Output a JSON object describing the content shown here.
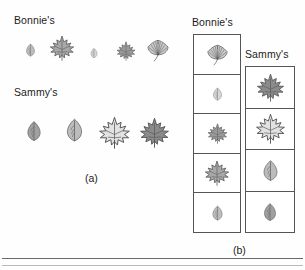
{
  "figure": {
    "panel_a": {
      "caption": "(a)",
      "rows": [
        {
          "label": "Bonnie's",
          "leaves": [
            {
              "name": "oval-leaf",
              "shape": "oval",
              "fill": "#bdbdbd",
              "w": 13,
              "h": 24
            },
            {
              "name": "maple-leaf",
              "shape": "maple",
              "fill": "#a8a8a8",
              "w": 26,
              "h": 28
            },
            {
              "name": "oval-leaf",
              "shape": "oval",
              "fill": "#d8d8d8",
              "w": 10,
              "h": 18
            },
            {
              "name": "maple-leaf",
              "shape": "maple",
              "fill": "#9a9a9a",
              "w": 20,
              "h": 22
            },
            {
              "name": "ginkgo-leaf",
              "shape": "ginkgo",
              "fill": "#c9c9c9",
              "w": 24,
              "h": 24
            }
          ]
        },
        {
          "label": "Sammy's",
          "leaves": [
            {
              "name": "oval-leaf",
              "shape": "oval",
              "fill": "#a0a0a0",
              "w": 20,
              "h": 36
            },
            {
              "name": "oval-leaf",
              "shape": "oval",
              "fill": "#bcbcbc",
              "w": 23,
              "h": 38
            },
            {
              "name": "maple-leaf",
              "shape": "maple",
              "fill": "#e2e2e2",
              "w": 33,
              "h": 33
            },
            {
              "name": "maple-leaf",
              "shape": "maple",
              "fill": "#8b8b8b",
              "w": 31,
              "h": 33
            }
          ]
        }
      ]
    },
    "panel_b": {
      "caption": "(b)",
      "columns": [
        {
          "label": "Bonnie's",
          "cells": [
            {
              "name": "ginkgo-leaf",
              "shape": "ginkgo",
              "fill": "#c9c9c9",
              "w": 23,
              "h": 23
            },
            {
              "name": "oval-leaf",
              "shape": "oval",
              "fill": "#d8d8d8",
              "w": 13,
              "h": 24
            },
            {
              "name": "maple-leaf",
              "shape": "maple",
              "fill": "#9a9a9a",
              "w": 21,
              "h": 23
            },
            {
              "name": "maple-leaf",
              "shape": "maple",
              "fill": "#a8a8a8",
              "w": 26,
              "h": 28
            },
            {
              "name": "oval-leaf",
              "shape": "oval",
              "fill": "#bdbdbd",
              "w": 15,
              "h": 28
            }
          ]
        },
        {
          "label": "Sammy's",
          "cells": [
            {
              "name": "maple-leaf",
              "shape": "maple",
              "fill": "#8b8b8b",
              "w": 29,
              "h": 31
            },
            {
              "name": "maple-leaf",
              "shape": "maple",
              "fill": "#e2e2e2",
              "w": 31,
              "h": 31
            },
            {
              "name": "oval-leaf",
              "shape": "oval",
              "fill": "#bcbcbc",
              "w": 21,
              "h": 35
            },
            {
              "name": "oval-leaf",
              "shape": "oval",
              "fill": "#a0a0a0",
              "w": 18,
              "h": 32
            }
          ]
        }
      ]
    },
    "colors": {
      "outline": "#555555",
      "text": "#1c1c1c",
      "rule": "#6a6a6a",
      "background": "#ffffff"
    }
  }
}
